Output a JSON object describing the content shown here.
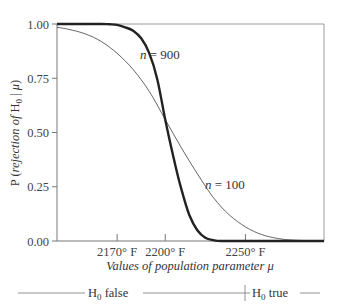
{
  "chart_data": {
    "type": "line",
    "title": "",
    "xlabel": "Values of population parameter μ",
    "ylabel": "P (rejection of H0 | μ)",
    "ylabel_parts": {
      "prefix": "P (",
      "italic": "rejection of",
      "mid": " H",
      "sub": "0",
      "bar": " | ",
      "mu": "μ",
      "suffix": ")"
    },
    "xlabel_parts": {
      "italic": "Values of population parameter ",
      "mu": "μ"
    },
    "xlim": [
      2132.5,
      2299
    ],
    "ylim": [
      0,
      1
    ],
    "grid": false,
    "x_ticks": [
      {
        "value": 2170,
        "label": "2170° F"
      },
      {
        "value": 2200,
        "label": "2200° F"
      },
      {
        "value": 2250,
        "label": "2250° F"
      }
    ],
    "y_ticks": [
      {
        "value": 0.0,
        "label": "0.00"
      },
      {
        "value": 0.25,
        "label": "0.25"
      },
      {
        "value": 0.5,
        "label": "0.50"
      },
      {
        "value": 0.75,
        "label": "0.75"
      },
      {
        "value": 1.0,
        "label": "1.00"
      }
    ],
    "series": [
      {
        "name": "n = 900",
        "label_n": "n",
        "label_value": " = 900",
        "style": "thick",
        "x": [
          2132.5,
          2150,
          2160,
          2165,
          2170,
          2175,
          2180,
          2185,
          2190,
          2195,
          2200,
          2205,
          2210,
          2215,
          2220,
          2225,
          2230,
          2235,
          2250,
          2299
        ],
        "values": [
          1.0,
          1.0,
          1.0,
          0.999,
          0.996,
          0.985,
          0.969,
          0.934,
          0.866,
          0.747,
          0.56,
          0.39,
          0.24,
          0.12,
          0.05,
          0.015,
          0.004,
          0.0,
          0.0,
          0.0
        ]
      },
      {
        "name": "n = 100",
        "label_n": "n",
        "label_value": " = 100",
        "style": "thin",
        "x": [
          2132.5,
          2140,
          2150,
          2160,
          2170,
          2180,
          2190,
          2200,
          2210,
          2220,
          2230,
          2240,
          2250,
          2260,
          2270,
          2280,
          2299
        ],
        "values": [
          0.985,
          0.975,
          0.955,
          0.92,
          0.865,
          0.79,
          0.69,
          0.56,
          0.43,
          0.31,
          0.2,
          0.12,
          0.065,
          0.03,
          0.012,
          0.004,
          0.0
        ]
      }
    ],
    "annotations": [
      {
        "text": "n = 900",
        "x": 2186,
        "y": 0.86
      },
      {
        "text": "n = 100",
        "x": 2233,
        "y": 0.25
      }
    ],
    "hypothesis_bar": {
      "split_at": 2250,
      "left_label": {
        "h": "H",
        "sub": "0",
        "rest": " false"
      },
      "right_label": {
        "h": "H",
        "sub": "0",
        "rest": " true"
      }
    }
  }
}
